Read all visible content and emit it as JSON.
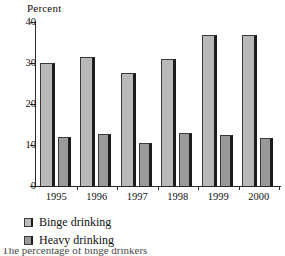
{
  "chart_data": {
    "type": "bar",
    "title": "",
    "xlabel": "",
    "ylabel": "Percent",
    "ylim": [
      0,
      40
    ],
    "yticks": [
      0,
      10,
      20,
      30,
      40
    ],
    "grid": false,
    "legend_position": "below-left",
    "categories": [
      "1995",
      "1996",
      "1997",
      "1998",
      "1999",
      "2000"
    ],
    "series": [
      {
        "name": "Binge drinking",
        "color": "#b9b9b9",
        "values": [
          29.9,
          31.5,
          27.6,
          30.9,
          36.9,
          36.8
        ]
      },
      {
        "name": "Heavy drinking",
        "color": "#9a9a9a",
        "values": [
          11.9,
          12.8,
          10.6,
          13.0,
          12.4,
          11.8
        ]
      }
    ]
  },
  "figure": {
    "axis_title": "Percent",
    "caption_partial": "The percentage of binge drinkers"
  },
  "colors": {
    "binge": "#b9b9b9",
    "heavy": "#9a9a9a",
    "axis": "#2a2a2a",
    "bar_edge": "#1c1c1c",
    "background": "#ffffff"
  }
}
